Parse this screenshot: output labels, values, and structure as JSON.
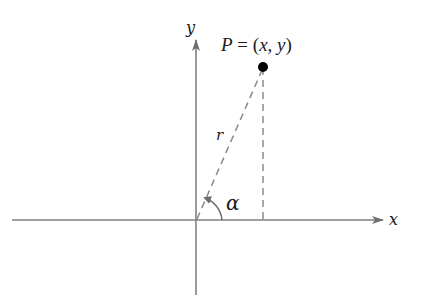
{
  "diagram": {
    "type": "coordinate-plane",
    "axes": {
      "x_label": "x",
      "y_label": "y",
      "color": "#808080"
    },
    "point": {
      "label_P": "P",
      "label_eq": " = (",
      "label_x": "x",
      "label_comma": ", ",
      "label_y": "y",
      "label_close": ")",
      "full_label": "P = (x, y)"
    },
    "radius_label": "r",
    "angle_label": "α",
    "colors": {
      "axis": "#808080",
      "dashed": "#8a8a8a",
      "point": "#000000",
      "text": "#1a1a1a"
    }
  }
}
